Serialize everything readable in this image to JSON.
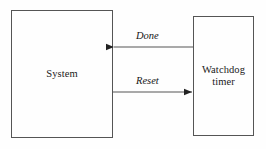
{
  "diagram": {
    "background_color": "#fefefe",
    "stroke_color": "#555555",
    "text_color": "#1a1a1a",
    "nodes": [
      {
        "id": "system",
        "label": "System",
        "x": 11,
        "y": 10,
        "width": 102,
        "height": 128
      },
      {
        "id": "watchdog",
        "label": "Watchdog\ntimer",
        "x": 193,
        "y": 16,
        "width": 61,
        "height": 120
      }
    ],
    "edges": [
      {
        "id": "done",
        "label": "Done",
        "from": "watchdog",
        "to": "system",
        "direction": "right-to-left",
        "y": 47,
        "x_start": 193,
        "x_end": 113,
        "label_x": 136,
        "label_y": 30
      },
      {
        "id": "reset",
        "label": "Reset",
        "from": "system",
        "to": "watchdog",
        "direction": "left-to-right",
        "y": 92,
        "x_start": 113,
        "x_end": 193,
        "label_x": 136,
        "label_y": 75
      }
    ]
  }
}
